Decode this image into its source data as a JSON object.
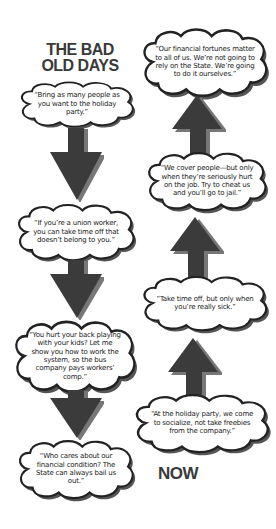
{
  "labels": {
    "start": "THE BAD\nOLD DAYS",
    "start_line1": "THE BAD",
    "start_line2": "OLD DAYS",
    "end": "NOW"
  },
  "colors": {
    "arrow": "#3b3b3b",
    "cloud_outline": "#222222",
    "cloud_shadow": "#555555",
    "text": "#1a1a1a",
    "title": "#3a3a3a",
    "background": "#ffffff"
  },
  "flow_direction": "down the left column from THE BAD OLD DAYS, then up the right column to NOW (top)",
  "bad_old_days": [
    {
      "quote": "“Bring as many people as you want to the holiday party.”"
    },
    {
      "quote": "“If you’re a union worker, you can take time off that doesn’t belong to you.”"
    },
    {
      "quote": "“You hurt your back playing with your kids? Let me show you how to work the system, so the bus company pays workers’ comp.”"
    },
    {
      "quote": "“Who cares about our financial condition? The State can always bail us out.”"
    }
  ],
  "now": [
    {
      "quote": "“At the holiday party, we come to socialize, not take freebies from the company.”"
    },
    {
      "quote": "“Take time off, but only when you’re really sick.”"
    },
    {
      "quote": "“We cover people—but only when they’re seriously hurt on the job. Try to cheat us and you’ll go to jail.”"
    },
    {
      "quote": "“Our financial fortunes matter to all of us. We’re not going to rely on the State. We’re going to do it ourselves.”"
    }
  ],
  "arrows": [
    {
      "id": "down-1",
      "direction": "down"
    },
    {
      "id": "down-2",
      "direction": "down"
    },
    {
      "id": "down-3",
      "direction": "down"
    },
    {
      "id": "up-1",
      "direction": "up"
    },
    {
      "id": "up-2",
      "direction": "up"
    },
    {
      "id": "up-3",
      "direction": "up"
    }
  ]
}
